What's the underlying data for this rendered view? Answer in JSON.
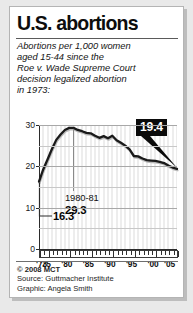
{
  "card": {
    "title": "U.S. abortions",
    "subtitle_lines": [
      "Abortions per 1,000 women",
      "aged 15-44 since the",
      "Roe v. Wade Supreme Court",
      "decision legalized abortion",
      "in 1973:"
    ]
  },
  "annotations": {
    "peak_years": "1980-81",
    "peak_value": "29.3",
    "start_value": "16.3",
    "end_value": "19.4"
  },
  "footer": {
    "copyright": "© 2008 MCT",
    "source": "Source: Guttmacher Institute",
    "graphic": "Graphic: Angela Smith"
  },
  "colors": {
    "line": "#1a1a1a",
    "callout_bg": "#0b0b0b",
    "callout_text": "#ffffff",
    "grid": "#c8c8c8",
    "stripe": "#ededed",
    "page_bg": "#e9e9e9",
    "card_bg": "#ffffff"
  },
  "chart_data": {
    "type": "line",
    "title": "U.S. abortions",
    "subtitle": "Abortions per 1,000 women aged 15-44 since the Roe v. Wade Supreme Court decision legalized abortion in 1973:",
    "xlabel": "",
    "ylabel": "Abortions per 1,000 women aged 15-44",
    "xlim": [
      1973,
      2005
    ],
    "ylim": [
      0,
      30
    ],
    "yticks": [
      0,
      10,
      20,
      30
    ],
    "ytick_labels": [
      "0",
      "10",
      "20",
      "30"
    ],
    "y_minor_gridlines": [
      5,
      15,
      25
    ],
    "xticks": [
      1973,
      1975,
      1980,
      1985,
      1990,
      1995,
      2000,
      2005
    ],
    "xtick_labels": [
      "'73",
      "'75",
      "'80",
      "'85",
      "'90",
      "'95",
      "'00",
      "'05"
    ],
    "grid": true,
    "legend": null,
    "x": [
      1973,
      1974,
      1975,
      1976,
      1977,
      1978,
      1979,
      1980,
      1981,
      1982,
      1983,
      1984,
      1985,
      1986,
      1987,
      1988,
      1989,
      1990,
      1991,
      1992,
      1993,
      1994,
      1995,
      1996,
      1997,
      1998,
      1999,
      2000,
      2001,
      2002,
      2003,
      2004,
      2005
    ],
    "values": [
      16.3,
      19.3,
      21.7,
      24.2,
      26.4,
      27.7,
      28.8,
      29.3,
      29.3,
      28.8,
      28.5,
      28.1,
      28.0,
      27.4,
      26.9,
      27.3,
      26.8,
      27.4,
      26.3,
      25.7,
      25.0,
      24.1,
      22.5,
      22.4,
      21.9,
      21.5,
      21.4,
      21.3,
      21.1,
      20.8,
      20.2,
      19.7,
      19.4
    ],
    "annotations": [
      {
        "label": "16.3",
        "x": 1973,
        "y": 16.3,
        "note": "first year after Roe v. Wade"
      },
      {
        "label": "1980-81 29.3",
        "x": 1981,
        "y": 29.3,
        "note": "peak rate"
      },
      {
        "label": "19.4",
        "x": 2005,
        "y": 19.4,
        "note": "latest year, callout box"
      }
    ],
    "source": "Guttmacher Institute"
  }
}
